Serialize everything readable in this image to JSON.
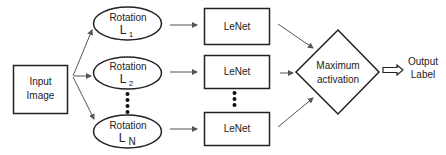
{
  "diagram": {
    "input": {
      "line1": "Input",
      "line2": "Image"
    },
    "rotations": [
      {
        "label": "Rotation",
        "letter": "L",
        "subscript": "1"
      },
      {
        "label": "Rotation",
        "letter": "L",
        "subscript": "2"
      },
      {
        "label": "Rotation",
        "letter": "L",
        "subscript": "N"
      }
    ],
    "networks": [
      {
        "label": "LeNet"
      },
      {
        "label": "LeNet"
      },
      {
        "label": "LeNet"
      }
    ],
    "aggregator": {
      "line1": "Maximum",
      "line2": "activation"
    },
    "output": {
      "line1": "Output",
      "line2": "Label"
    },
    "colors": {
      "stroke": "#222222",
      "arrow": "#555555",
      "background": "#ffffff"
    }
  }
}
